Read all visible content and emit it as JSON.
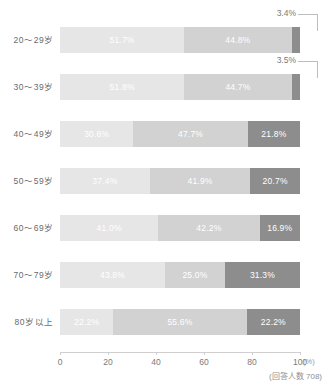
{
  "chart_data": {
    "type": "bar",
    "orientation": "horizontal",
    "stacked": true,
    "normalized_percent": true,
    "title": "",
    "xlabel": "",
    "ylabel": "",
    "xlim": [
      0,
      100
    ],
    "axis_unit": "(%)",
    "grid": false,
    "legend_position": "none",
    "note": "(回答人数 708)",
    "ticks": [
      "0",
      "20",
      "40",
      "60",
      "80",
      "100"
    ],
    "tick_values": [
      0,
      20,
      40,
      60,
      80,
      100
    ],
    "categories": [
      "20～29岁",
      "30～39岁",
      "40～49岁",
      "50～59岁",
      "60～69岁",
      "70～79岁",
      "80岁以上"
    ],
    "series": [
      {
        "name": "segment-1",
        "color": "#e6e6e6",
        "values": [
          51.7,
          51.8,
          30.6,
          37.4,
          41.0,
          43.8,
          22.2
        ]
      },
      {
        "name": "segment-2",
        "color": "#d2d2d2",
        "values": [
          44.8,
          44.7,
          47.7,
          41.9,
          42.2,
          25.0,
          55.6
        ]
      },
      {
        "name": "segment-3",
        "color": "#8d8d8d",
        "values": [
          3.4,
          3.5,
          21.8,
          20.7,
          16.9,
          31.3,
          22.2
        ]
      }
    ]
  },
  "rows": [
    {
      "label": "20～29岁",
      "segments": [
        {
          "value": 51.7,
          "text": "51.7%"
        },
        {
          "value": 44.8,
          "text": "44.8%"
        },
        {
          "value": 3.4,
          "text": "3.4%"
        }
      ],
      "callout": "3.4%"
    },
    {
      "label": "30～39岁",
      "segments": [
        {
          "value": 51.8,
          "text": "51.8%"
        },
        {
          "value": 44.7,
          "text": "44.7%"
        },
        {
          "value": 3.5,
          "text": "3.5%"
        }
      ],
      "callout": "3.5%"
    },
    {
      "label": "40～49岁",
      "segments": [
        {
          "value": 30.6,
          "text": "30.6%"
        },
        {
          "value": 47.7,
          "text": "47.7%"
        },
        {
          "value": 21.8,
          "text": "21.8%"
        }
      ],
      "callout": null
    },
    {
      "label": "50～59岁",
      "segments": [
        {
          "value": 37.4,
          "text": "37.4%"
        },
        {
          "value": 41.9,
          "text": "41.9%"
        },
        {
          "value": 20.7,
          "text": "20.7%"
        }
      ],
      "callout": null
    },
    {
      "label": "60～69岁",
      "segments": [
        {
          "value": 41.0,
          "text": "41.0%"
        },
        {
          "value": 42.2,
          "text": "42.2%"
        },
        {
          "value": 16.9,
          "text": "16.9%"
        }
      ],
      "callout": null
    },
    {
      "label": "70～79岁",
      "segments": [
        {
          "value": 43.8,
          "text": "43.8%"
        },
        {
          "value": 25.0,
          "text": "25.0%"
        },
        {
          "value": 31.3,
          "text": "31.3%"
        }
      ],
      "callout": null
    },
    {
      "label": "80岁以上",
      "segments": [
        {
          "value": 22.2,
          "text": "22.2%"
        },
        {
          "value": 55.6,
          "text": "55.6%"
        },
        {
          "value": 22.2,
          "text": "22.2%"
        }
      ],
      "callout": null
    }
  ],
  "axis": {
    "ticks": [
      "0",
      "20",
      "40",
      "60",
      "80",
      "100"
    ],
    "unit": "(%)",
    "note": "(回答人数 708)"
  }
}
